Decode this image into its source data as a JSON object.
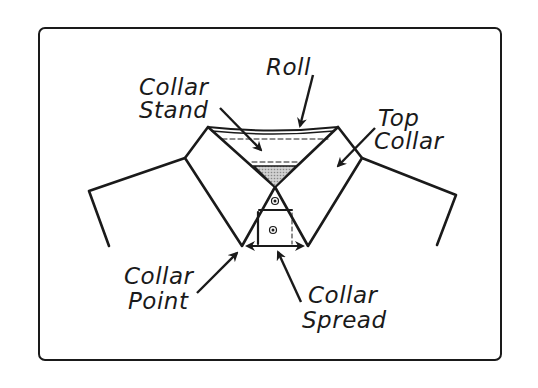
{
  "diagram": {
    "labels": {
      "roll": "Roll",
      "collar_stand_line1": "Collar",
      "collar_stand_line2": "Stand",
      "top_collar_line1": "Top",
      "top_collar_line2": "Collar",
      "collar_point_line1": "Collar",
      "collar_point_line2": "Point",
      "collar_spread_line1": "Collar",
      "collar_spread_line2": "Spread"
    },
    "colors": {
      "stroke": "#1a1a1a",
      "stand_fill": "#b8b8b8",
      "background": "#ffffff"
    }
  }
}
